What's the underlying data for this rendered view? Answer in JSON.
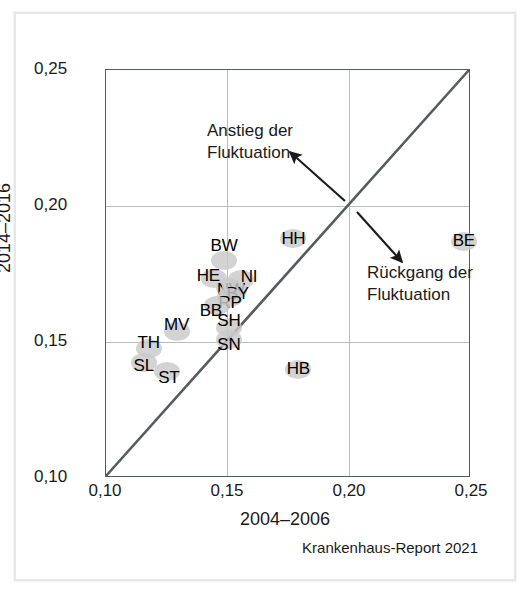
{
  "axes": {
    "x_title": "2004–2006",
    "y_title": "2014–2016",
    "x_ticks": [
      "0,10",
      "0,15",
      "0,20",
      "0,25"
    ],
    "y_ticks": [
      "0,10",
      "0,15",
      "0,20",
      "0,25"
    ]
  },
  "annotations": {
    "up_line1": "Anstieg der",
    "up_line2": "Fluktuation",
    "down_line1": "Rückgang der",
    "down_line2": "Fluktuation"
  },
  "source": "Krankenhaus-Report 2021",
  "colors": {
    "marker": "#c9c9c9",
    "line": "#555a5c",
    "grid": "#b9bcbe",
    "text": "#1a1a1a",
    "frame": "#e7e7e7"
  },
  "point_labels": {
    "p0": "BW",
    "p1": "HE",
    "p2": "NI",
    "p3": "NW",
    "p4": "BY",
    "p5": "RP",
    "p6": "BB",
    "p7": "BE",
    "p8": "HH",
    "p9": "SH",
    "p10": "SN",
    "p11": "MV",
    "p12": "TH",
    "p13": "SL",
    "p14": "ST",
    "p15": "HB"
  },
  "chart_data": {
    "type": "scatter",
    "title": "",
    "xlabel": "2004–2006",
    "ylabel": "2014–2016",
    "xlim": [
      0.1,
      0.25
    ],
    "ylim": [
      0.1,
      0.25
    ],
    "xticks": [
      0.1,
      0.15,
      0.2,
      0.25
    ],
    "yticks": [
      0.1,
      0.15,
      0.2,
      0.25
    ],
    "grid": true,
    "legend": "none",
    "reference_line": {
      "label": "identity",
      "from": [
        0.1,
        0.1
      ],
      "to": [
        0.25,
        0.25
      ]
    },
    "points": [
      {
        "label": "BW",
        "x": 0.1485,
        "y": 0.18
      },
      {
        "label": "HE",
        "x": 0.1445,
        "y": 0.1735
      },
      {
        "label": "NI",
        "x": 0.1555,
        "y": 0.173
      },
      {
        "label": "NW",
        "x": 0.1505,
        "y": 0.17
      },
      {
        "label": "BY",
        "x": 0.1525,
        "y": 0.169
      },
      {
        "label": "RP",
        "x": 0.151,
        "y": 0.1665
      },
      {
        "label": "BB",
        "x": 0.1455,
        "y": 0.1635
      },
      {
        "label": "BE",
        "x": 0.247,
        "y": 0.187
      },
      {
        "label": "HH",
        "x": 0.177,
        "y": 0.188
      },
      {
        "label": "SH",
        "x": 0.1505,
        "y": 0.1555
      },
      {
        "label": "SN",
        "x": 0.1505,
        "y": 0.151
      },
      {
        "label": "MV",
        "x": 0.129,
        "y": 0.154
      },
      {
        "label": "TH",
        "x": 0.1175,
        "y": 0.1475
      },
      {
        "label": "SL",
        "x": 0.1155,
        "y": 0.1425
      },
      {
        "label": "ST",
        "x": 0.125,
        "y": 0.139
      },
      {
        "label": "HB",
        "x": 0.179,
        "y": 0.14
      }
    ],
    "annotations": [
      {
        "text": "Anstieg der Fluktuation",
        "arrow_from": [
          0.1975,
          0.201
        ],
        "arrow_to": [
          0.175,
          0.219
        ]
      },
      {
        "text": "Rückgang der Fluktuation",
        "arrow_from": [
          0.203,
          0.196
        ],
        "arrow_to": [
          0.2195,
          0.1775
        ]
      }
    ]
  }
}
